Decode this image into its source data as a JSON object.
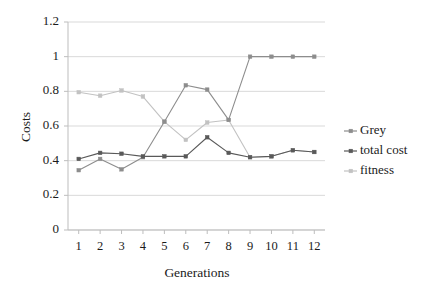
{
  "chart_data": {
    "type": "line",
    "title": "",
    "xlabel": "Generations",
    "ylabel": "Costs",
    "categories": [
      "1",
      "2",
      "3",
      "4",
      "5",
      "6",
      "7",
      "8",
      "9",
      "10",
      "11",
      "12"
    ],
    "x": [
      1,
      2,
      3,
      4,
      5,
      6,
      7,
      8,
      9,
      10,
      11,
      12
    ],
    "xlim": [
      0.5,
      12.5
    ],
    "ylim": [
      0,
      1.2
    ],
    "yticks": [
      "0",
      "0.2",
      "0.4",
      "0.6",
      "0.8",
      "1",
      "1.2"
    ],
    "ytick_values": [
      0,
      0.2,
      0.4,
      0.6,
      0.8,
      1,
      1.2
    ],
    "grid": "horizontal",
    "legend_position": "right",
    "series": [
      {
        "name": "Grey",
        "color": "#8d8d8d",
        "marker": "square",
        "values": [
          0.345,
          0.41,
          0.35,
          0.42,
          0.625,
          0.835,
          0.81,
          0.635,
          1.0,
          1.0,
          1.0,
          1.0
        ]
      },
      {
        "name": "total cost",
        "color": "#595959",
        "marker": "square",
        "values": [
          0.41,
          0.445,
          0.44,
          0.425,
          0.425,
          0.425,
          0.535,
          0.445,
          0.42,
          0.425,
          0.46,
          0.45
        ]
      },
      {
        "name": "fitness",
        "color": "#c2c2c2",
        "marker": "square",
        "values": [
          0.795,
          0.775,
          0.805,
          0.77,
          0.625,
          0.52,
          0.62,
          0.635,
          0.42,
          0.425,
          0.46,
          0.45
        ]
      }
    ]
  },
  "axes": {
    "y_title": "Costs",
    "x_title": "Generations"
  },
  "legend": {
    "entries": [
      {
        "label": "Grey"
      },
      {
        "label": "total cost"
      },
      {
        "label": "fitness"
      }
    ]
  },
  "colors": {
    "grid": "#d9d9d9",
    "axis": "#bdbdbd",
    "text": "#1b1b1b",
    "series_grey": "#8d8d8d",
    "series_total_cost": "#595959",
    "series_fitness": "#c2c2c2"
  }
}
